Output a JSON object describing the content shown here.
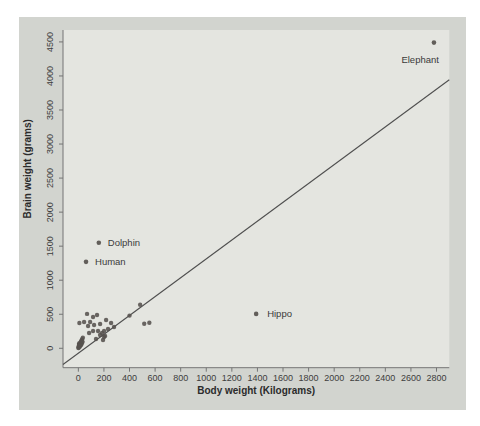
{
  "figure": {
    "background_color": "#ffffff",
    "panel_color": "#d2d4cf",
    "plot_area_color": "#e4e5e0",
    "axis_line_color": "#757575",
    "tick_text_color": "#3d3d3d",
    "dot_color": "#57524e",
    "line_color": "#4f4f4f"
  },
  "chart_data": {
    "type": "scatter",
    "title": "",
    "xlabel": "Body weight (Kilograms)",
    "ylabel": "Brain weight (grams)",
    "xlim": [
      -120,
      2900
    ],
    "ylim": [
      -285,
      4675
    ],
    "x_ticks": [
      0,
      200,
      400,
      600,
      800,
      1000,
      1200,
      1400,
      1600,
      1800,
      2000,
      2200,
      2400,
      2600,
      2800
    ],
    "y_ticks": [
      0,
      500,
      1000,
      1500,
      2000,
      2500,
      3000,
      3500,
      4000,
      4500
    ],
    "grid": false,
    "legend": "none",
    "regression_line": {
      "x1": -120,
      "y1": -238,
      "x2": 2900,
      "y2": 3945
    },
    "points": [
      [
        1,
        5
      ],
      [
        2,
        12
      ],
      [
        3,
        20
      ],
      [
        4,
        35
      ],
      [
        5,
        50
      ],
      [
        6,
        70
      ],
      [
        8,
        45
      ],
      [
        10,
        60
      ],
      [
        12,
        25
      ],
      [
        14,
        75
      ],
      [
        16,
        40
      ],
      [
        18,
        90
      ],
      [
        20,
        50
      ],
      [
        22,
        105
      ],
      [
        25,
        62
      ],
      [
        26,
        120
      ],
      [
        28,
        80
      ],
      [
        30,
        135
      ],
      [
        33,
        95
      ],
      [
        35,
        155
      ],
      [
        8,
        372
      ],
      [
        45,
        386
      ],
      [
        68,
        505
      ],
      [
        76,
        327
      ],
      [
        84,
        225
      ],
      [
        92,
        386
      ],
      [
        115,
        460
      ],
      [
        115,
        254
      ],
      [
        123,
        342
      ],
      [
        138,
        137
      ],
      [
        146,
        490
      ],
      [
        154,
        254
      ],
      [
        170,
        357
      ],
      [
        170,
        196
      ],
      [
        185,
        225
      ],
      [
        193,
        122
      ],
      [
        201,
        254
      ],
      [
        201,
        166
      ],
      [
        209,
        181
      ],
      [
        217,
        416
      ],
      [
        232,
        284
      ],
      [
        256,
        372
      ],
      [
        279,
        313
      ],
      [
        400,
        480
      ],
      [
        483,
        640
      ],
      [
        515,
        360
      ],
      [
        555,
        375
      ]
    ],
    "labeled_points": [
      {
        "label": "Human",
        "x": 60,
        "y": 1270,
        "anchor": "start",
        "dx": 9,
        "dy": 3
      },
      {
        "label": "Dolphin",
        "x": 160,
        "y": 1550,
        "anchor": "start",
        "dx": 9,
        "dy": 3
      },
      {
        "label": "Hippo",
        "x": 1390,
        "y": 505,
        "anchor": "start",
        "dx": 11,
        "dy": 3
      },
      {
        "label": "Elephant",
        "x": 2780,
        "y": 4490,
        "anchor": "end",
        "dx": 5,
        "dy": 20
      }
    ]
  }
}
